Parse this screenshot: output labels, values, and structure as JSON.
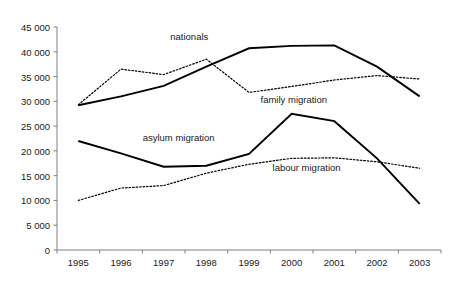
{
  "chart_data": {
    "type": "line",
    "title": "",
    "subtitle": "",
    "xlabel": "",
    "ylabel": "",
    "categories": [
      "1995",
      "1996",
      "1997",
      "1998",
      "1999",
      "2000",
      "2001",
      "2002",
      "2003"
    ],
    "x": [
      1995,
      1996,
      1997,
      1998,
      1999,
      2000,
      2001,
      2002,
      2003
    ],
    "ylim": [
      0,
      45000
    ],
    "ytick_values": [
      0,
      5000,
      10000,
      15000,
      20000,
      25000,
      30000,
      35000,
      40000,
      45000
    ],
    "ytick_labels": [
      "0",
      "5 000",
      "10 000",
      "15 000",
      "20 000",
      "25 000",
      "30 000",
      "35 000",
      "40 000",
      "45 000"
    ],
    "grid": false,
    "legend_position": "inline-annotations",
    "series": [
      {
        "name": "nationals",
        "style": "solid",
        "color": "#000000",
        "values": [
          29200,
          31000,
          33100,
          37000,
          40700,
          41200,
          41300,
          37000,
          31000
        ],
        "label_x": 1997.6,
        "label_y": 43100
      },
      {
        "name": "family migration",
        "style": "dotted",
        "color": "#000000",
        "values": [
          29300,
          36500,
          35400,
          38500,
          31800,
          33000,
          34300,
          35200,
          34500
        ],
        "label_x": 2000.05,
        "label_y": 30400
      },
      {
        "name": "asylum migration",
        "style": "solid",
        "color": "#000000",
        "values": [
          22000,
          19500,
          16800,
          17000,
          19400,
          27500,
          26000,
          18500,
          9300
        ],
        "label_x": 1997.35,
        "label_y": 22900
      },
      {
        "name": "labour migration",
        "style": "dotted",
        "color": "#000000",
        "values": [
          10000,
          12500,
          13000,
          15500,
          17300,
          18500,
          18600,
          17800,
          16500
        ],
        "label_x": 2000.35,
        "label_y": 16700
      }
    ]
  },
  "axis": {
    "axis_color": "#808080",
    "tick_color": "#808080",
    "text_color": "#1a1a1a"
  }
}
